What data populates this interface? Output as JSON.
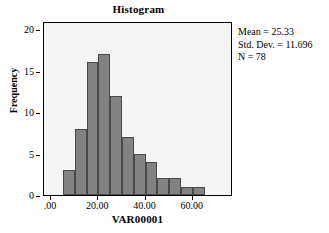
{
  "chart_data": {
    "type": "bar",
    "title": "Histogram",
    "xlabel": "VAR00001",
    "ylabel": "Frequency",
    "xlim": [
      -3,
      77
    ],
    "ylim": [
      0,
      21
    ],
    "grid": false,
    "bin_width": 5,
    "bin_starts": [
      5,
      10,
      15,
      20,
      25,
      30,
      35,
      40,
      45,
      50,
      55,
      60
    ],
    "categories": [
      "5-10",
      "10-15",
      "15-20",
      "20-25",
      "25-30",
      "30-35",
      "35-40",
      "40-45",
      "45-50",
      "50-55",
      "55-60",
      "60-65"
    ],
    "values": [
      3,
      8,
      16,
      17,
      12,
      7,
      5,
      4,
      2,
      2,
      1,
      1
    ],
    "bar_color": "#828282",
    "bar_edge_color": "#4a4a4a",
    "plot_background": "#f5f5f5",
    "x_ticks": [
      {
        "value": 0,
        "label": ".00"
      },
      {
        "value": 20,
        "label": "20.00"
      },
      {
        "value": 40,
        "label": "40.00"
      },
      {
        "value": 60,
        "label": "60.00"
      }
    ],
    "y_ticks": [
      {
        "value": 0,
        "label": "0"
      },
      {
        "value": 5,
        "label": "5"
      },
      {
        "value": 10,
        "label": "10"
      },
      {
        "value": 15,
        "label": "15"
      },
      {
        "value": 20,
        "label": "20"
      }
    ],
    "annotations": [
      "Mean = 25.33",
      "Std. Dev. = 11.696",
      "N = 78"
    ]
  },
  "stats": {
    "mean_line": "Mean = 25.33",
    "stddev_line": "Std. Dev. = 11.696",
    "n_line": "N = 78"
  }
}
